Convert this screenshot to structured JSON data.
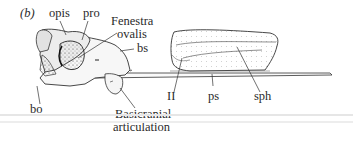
{
  "figure": {
    "panel_label": "(b)",
    "labels": {
      "opis": "opis",
      "pro": "pro",
      "fenestra_line1": "Fenestra",
      "fenestra_line2": "ovalis",
      "bs": "bs",
      "bo": "bo",
      "basicranial_line1": "Basicranial",
      "basicranial_line2": "articulation",
      "II": "II",
      "ps": "ps",
      "sph": "sph"
    }
  },
  "colors": {
    "ink": "#2a2a2a",
    "rule": "#e6e6e6"
  }
}
